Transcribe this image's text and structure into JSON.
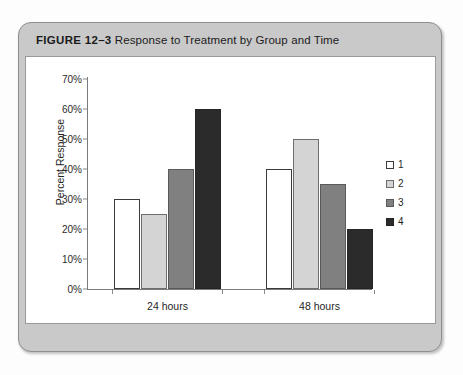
{
  "figure": {
    "label": "FIGURE 12–3",
    "title": "Response to Treatment by Group and Time"
  },
  "chart_data": {
    "type": "bar",
    "title": "Response to Treatment by Group and Time",
    "xlabel": "",
    "ylabel": "Percent Response",
    "ylim": [
      0,
      70
    ],
    "ytick_labels": [
      "0%",
      "10%",
      "20%",
      "30%",
      "40%",
      "50%",
      "60%",
      "70%"
    ],
    "ytick_values": [
      0,
      10,
      20,
      30,
      40,
      50,
      60,
      70
    ],
    "grid": false,
    "legend_position": "right",
    "categories": [
      "24 hours",
      "48 hours"
    ],
    "series": [
      {
        "name": "1",
        "color": "#ffffff",
        "values": [
          30,
          40
        ]
      },
      {
        "name": "2",
        "color": "#d4d4d4",
        "values": [
          25,
          50
        ]
      },
      {
        "name": "3",
        "color": "#808080",
        "values": [
          40,
          35
        ]
      },
      {
        "name": "4",
        "color": "#2b2b2b",
        "values": [
          60,
          20
        ]
      }
    ]
  }
}
